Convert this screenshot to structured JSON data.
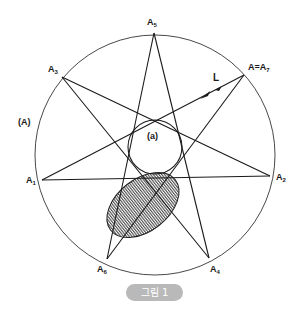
{
  "figure": {
    "outer_circle": {
      "label": "(A)",
      "cx": 155,
      "cy": 155,
      "r": 120
    },
    "inner_circle": {
      "label": "(a)",
      "cx": 155,
      "cy": 147,
      "r": 27
    },
    "vertices": [
      {
        "name": "A1",
        "label": "A",
        "sub": "1",
        "x": 42,
        "y": 180
      },
      {
        "name": "A2",
        "label": "A",
        "sub": "2",
        "x": 270,
        "y": 176
      },
      {
        "name": "A3",
        "label": "A",
        "sub": "3",
        "x": 62,
        "y": 77
      },
      {
        "name": "A4",
        "label": "A",
        "sub": "4",
        "x": 209,
        "y": 258
      },
      {
        "name": "A5",
        "label": "A",
        "sub": "5",
        "x": 154,
        "y": 33
      },
      {
        "name": "A6",
        "label": "A",
        "sub": "6",
        "x": 107,
        "y": 259
      },
      {
        "name": "A7",
        "label": "A=A",
        "sub": "7",
        "x": 244,
        "y": 75
      }
    ],
    "line_label": "L",
    "shaded_ellipse": {
      "cx": 143,
      "cy": 205,
      "rx": 41,
      "ry": 26,
      "rotate": -38
    }
  },
  "caption": "그림 1"
}
